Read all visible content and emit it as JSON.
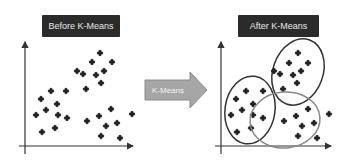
{
  "before": {
    "title": "Before K-Means",
    "points": [
      [
        100,
        53
      ],
      [
        92,
        62
      ],
      [
        112,
        62
      ],
      [
        77,
        71
      ],
      [
        83,
        74
      ],
      [
        96,
        75
      ],
      [
        104,
        71
      ],
      [
        101,
        83
      ],
      [
        86,
        89
      ],
      [
        51,
        91
      ],
      [
        66,
        91
      ],
      [
        41,
        99
      ],
      [
        57,
        104
      ],
      [
        36,
        115
      ],
      [
        46,
        110
      ],
      [
        58,
        115
      ],
      [
        67,
        118
      ],
      [
        42,
        132
      ],
      [
        55,
        128
      ],
      [
        87,
        121
      ],
      [
        99,
        116
      ],
      [
        111,
        109
      ],
      [
        106,
        126
      ],
      [
        117,
        123
      ],
      [
        101,
        136
      ],
      [
        120,
        138
      ],
      [
        132,
        114
      ]
    ]
  },
  "arrow": {
    "label": "K-Means",
    "color": "#a6a6a6"
  },
  "after": {
    "title": "After K-Means",
    "clusters": [
      {
        "ellipse": [
          298,
          72,
          25,
          34,
          20
        ],
        "stroke": "#333333",
        "points": [
          [
            298,
            53
          ],
          [
            289,
            63
          ],
          [
            308,
            63
          ],
          [
            274,
            71
          ],
          [
            280,
            74
          ],
          [
            293,
            75
          ],
          [
            301,
            71
          ],
          [
            297,
            83
          ],
          [
            283,
            89
          ]
        ]
      },
      {
        "ellipse": [
          250,
          110,
          25,
          34,
          8
        ],
        "stroke": "#333333",
        "points": [
          [
            246,
            91
          ],
          [
            263,
            91
          ],
          [
            236,
            99
          ],
          [
            253,
            104
          ],
          [
            231,
            115
          ],
          [
            242,
            110
          ],
          [
            253,
            115
          ],
          [
            263,
            118
          ],
          [
            237,
            132
          ],
          [
            251,
            128
          ]
        ]
      },
      {
        "ellipse": [
          285,
          120,
          35,
          28,
          -5
        ],
        "stroke": "#888888",
        "points": [
          [
            284,
            121
          ],
          [
            296,
            116
          ],
          [
            308,
            109
          ],
          [
            302,
            126
          ],
          [
            314,
            123
          ],
          [
            298,
            136
          ],
          [
            317,
            138
          ],
          [
            329,
            114
          ]
        ]
      }
    ]
  }
}
